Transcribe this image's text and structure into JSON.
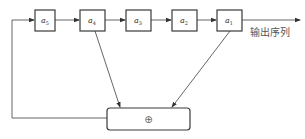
{
  "diagram": {
    "type": "linear-feedback-shift-register",
    "registers": [
      {
        "id": "a5",
        "label": "a",
        "subscript": "5"
      },
      {
        "id": "a4",
        "label": "a",
        "subscript": "4"
      },
      {
        "id": "a3",
        "label": "a",
        "subscript": "3"
      },
      {
        "id": "a2",
        "label": "a",
        "subscript": "2"
      },
      {
        "id": "a1",
        "label": "a",
        "subscript": "1"
      }
    ],
    "output_label": "输出序列",
    "adder_symbol": "⊕",
    "taps": [
      "a4",
      "a1"
    ],
    "colors": {
      "stroke": "#3a3a3a",
      "line": "#555555",
      "background": "#ffffff"
    }
  }
}
